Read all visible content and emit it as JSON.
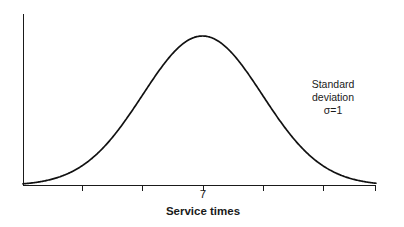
{
  "figure": {
    "background_color": "#ffffff",
    "line_color": "#111111",
    "width": 404,
    "height": 227
  },
  "axes": {
    "x_axis_title": "Service times",
    "y_axis_title": "",
    "mean_tick_label": "7"
  },
  "annotation": {
    "line1": "Standard deviation",
    "line2": "σ=1"
  },
  "chart_data": {
    "type": "line",
    "title": "",
    "subtitle": "",
    "xlabel": "Service times",
    "ylabel": "",
    "grid": false,
    "legend": null,
    "distribution": "normal",
    "mean": 7,
    "std_dev": 1,
    "annotations": [
      {
        "text": "Standard deviation",
        "x": 9.1,
        "y": 0.76
      },
      {
        "text": "σ=1",
        "x": 9.1,
        "y": 0.68
      }
    ],
    "xlim": [
      4.0,
      9.9
    ],
    "ylim": [
      0,
      1.05
    ],
    "x_tick_values": [
      5,
      6,
      7,
      8,
      9
    ],
    "x_tick_labels": [
      "",
      "",
      "7",
      "",
      ""
    ],
    "x": [
      4.0,
      4.2,
      4.4,
      4.6,
      4.8,
      5.0,
      5.2,
      5.4,
      5.6,
      5.8,
      6.0,
      6.2,
      6.4,
      6.6,
      6.8,
      7.0,
      7.2,
      7.4,
      7.6,
      7.8,
      8.0,
      8.2,
      8.4,
      8.6,
      8.8,
      9.0,
      9.2,
      9.4,
      9.6,
      9.9
    ],
    "y": [
      0.011,
      0.018,
      0.029,
      0.044,
      0.066,
      0.097,
      0.136,
      0.186,
      0.247,
      0.318,
      0.396,
      0.478,
      0.56,
      0.637,
      0.704,
      0.757,
      0.794,
      0.812,
      0.812,
      0.794,
      0.757,
      0.704,
      0.637,
      0.56,
      0.478,
      0.396,
      0.318,
      0.247,
      0.186,
      0.097
    ]
  }
}
